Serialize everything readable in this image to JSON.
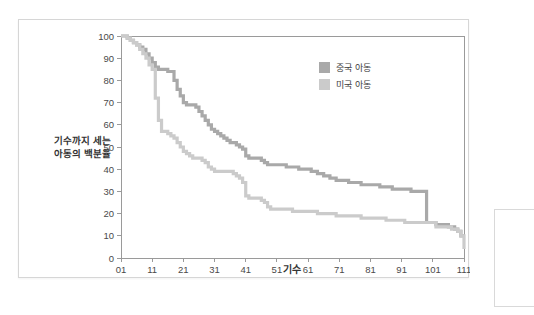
{
  "chart_data": {
    "type": "line",
    "subtype": "step-survival-curve",
    "title": "",
    "xlabel": "기수",
    "ylabel": "기수까지 세는\n아동의 백분율",
    "ylabel_line1": "기수까지 세는",
    "ylabel_line2": "아동의 백분율",
    "xlim": [
      1,
      111
    ],
    "ylim": [
      0,
      100
    ],
    "xticks": [
      "01",
      "11",
      "21",
      "31",
      "41",
      "51",
      "61",
      "71",
      "81",
      "91",
      "101",
      "111"
    ],
    "xtick_values": [
      1,
      11,
      21,
      31,
      41,
      51,
      61,
      71,
      81,
      91,
      101,
      111
    ],
    "yticks": [
      "0",
      "10",
      "20",
      "30",
      "40",
      "50",
      "60",
      "70",
      "80",
      "90",
      "100"
    ],
    "ytick_values": [
      0,
      10,
      20,
      30,
      40,
      50,
      60,
      70,
      80,
      90,
      100
    ],
    "grid": "horizontal",
    "legend_position": "top-right",
    "series": [
      {
        "name": "중국 아동",
        "color": "#a9a9a9",
        "x": [
          1,
          2,
          3,
          4,
          5,
          6,
          7,
          8,
          9,
          10,
          11,
          12,
          13,
          14,
          15,
          16,
          17,
          18,
          19,
          20,
          21,
          22,
          23,
          24,
          25,
          26,
          27,
          28,
          29,
          30,
          31,
          32,
          33,
          34,
          35,
          36,
          37,
          38,
          39,
          40,
          41,
          42,
          43,
          44,
          45,
          46,
          47,
          48,
          50,
          52,
          54,
          56,
          58,
          60,
          62,
          64,
          66,
          68,
          70,
          72,
          74,
          76,
          78,
          80,
          82,
          84,
          86,
          88,
          90,
          92,
          94,
          96,
          97,
          98,
          99,
          100,
          102,
          104,
          106,
          107,
          108,
          109,
          110,
          111
        ],
        "y": [
          100,
          100,
          99,
          98,
          97,
          96,
          95,
          94,
          92,
          90,
          88,
          86,
          85,
          85,
          85,
          84,
          84,
          80,
          76,
          73,
          70,
          69,
          69,
          69,
          68,
          66,
          64,
          62,
          60,
          58,
          57,
          56,
          55,
          54,
          53,
          52,
          52,
          51,
          50,
          49,
          46,
          45,
          45,
          45,
          45,
          44,
          43,
          42,
          42,
          42,
          41,
          41,
          40,
          40,
          39,
          38,
          37,
          36,
          35,
          35,
          34,
          34,
          33,
          33,
          33,
          32,
          32,
          31,
          31,
          31,
          30,
          30,
          30,
          30,
          16,
          16,
          15,
          15,
          14,
          14,
          13,
          12,
          10,
          10
        ]
      },
      {
        "name": "미국 아동",
        "color": "#cbcbcb",
        "x": [
          1,
          2,
          3,
          4,
          5,
          6,
          7,
          8,
          9,
          10,
          11,
          12,
          13,
          14,
          15,
          16,
          17,
          18,
          19,
          20,
          21,
          22,
          23,
          24,
          25,
          26,
          27,
          28,
          29,
          30,
          31,
          32,
          33,
          34,
          35,
          36,
          37,
          38,
          39,
          40,
          41,
          42,
          43,
          44,
          45,
          46,
          47,
          48,
          49,
          50,
          52,
          54,
          56,
          58,
          60,
          62,
          64,
          66,
          68,
          70,
          72,
          74,
          76,
          78,
          80,
          82,
          84,
          86,
          88,
          90,
          92,
          94,
          96,
          98,
          100,
          102,
          104,
          105,
          106,
          107,
          108,
          109,
          110,
          111
        ],
        "y": [
          100,
          100,
          99,
          98,
          97,
          96,
          94,
          92,
          90,
          87,
          85,
          72,
          62,
          57,
          57,
          56,
          55,
          54,
          52,
          50,
          48,
          47,
          46,
          45,
          45,
          45,
          44,
          43,
          41,
          40,
          39,
          39,
          39,
          39,
          39,
          39,
          38,
          37,
          36,
          34,
          28,
          27,
          27,
          27,
          27,
          26,
          25,
          23,
          22,
          22,
          22,
          22,
          21,
          21,
          21,
          21,
          20,
          20,
          20,
          19,
          19,
          19,
          19,
          18,
          18,
          18,
          18,
          17,
          17,
          17,
          16,
          16,
          16,
          16,
          16,
          14,
          14,
          14,
          14,
          13,
          13,
          12,
          10,
          4
        ]
      }
    ]
  },
  "legend": {
    "items": [
      {
        "label": "중국 아동",
        "color": "#a9a9a9"
      },
      {
        "label": "미국 아동",
        "color": "#cbcbcb"
      }
    ]
  },
  "colors": {
    "series_china": "#a9a9a9",
    "series_usa": "#cbcbcb",
    "grid": "#e3e3e3",
    "frame": "#9a9a9a",
    "card_border": "#d6d6d6",
    "text": "#3d3d3d",
    "background": "#ffffff"
  }
}
